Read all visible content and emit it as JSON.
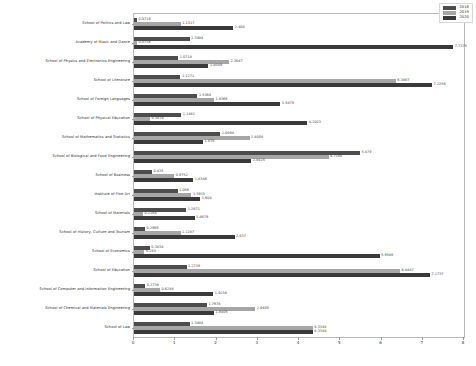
{
  "chart_data": {
    "type": "bar",
    "orientation": "horizontal",
    "title": "",
    "xlabel": "",
    "ylabel": "",
    "xlim": [
      0,
      8
    ],
    "xticks": [
      "0",
      "1",
      "2",
      "3",
      "4",
      "5",
      "6",
      "7",
      "8"
    ],
    "grid": false,
    "legend_position": "upper right",
    "categories": [
      "School of Politics and Law",
      "Academy of Music and Dance",
      "School of Physics and Electronics Engineering",
      "School of Literature",
      "School of Foreign Languages",
      "School of Physical Education",
      "School of Mathematics and Statistics",
      "School of Biological and Food Engineering",
      "School of Business",
      "Institute of Fine Art",
      "School of Materials",
      "School of History, Culture and Tourism",
      "School of Economics",
      "School of Education",
      "School of Computer and Information Engineering",
      "School of Chemical and Materials Engineering",
      "School of Law"
    ],
    "series": [
      {
        "name": "2018",
        "color": "#4d4d4d",
        "values": [
          0.0719,
          1.3484,
          1.0718,
          1.1271,
          1.5364,
          1.1481,
          2.0894,
          5.479,
          0.435,
          1.056,
          1.2671,
          0.2695,
          0.3834,
          1.2739,
          0.2738,
          1.7678,
          1.3484
        ],
        "labels": [
          "0.0719",
          "1.3484",
          "1.0718",
          "1.1271",
          "1.5364",
          "1.1481",
          "2.0894",
          "5.479",
          "0.435",
          "1.056",
          "1.2671",
          "0.2695",
          "0.3834",
          "1.2739",
          "0.2738",
          "1.7678",
          "1.3484"
        ]
      },
      {
        "name": "2019",
        "color": "#a6a6a6",
        "values": [
          1.1317,
          0.0716,
          2.3047,
          6.3467,
          1.9366,
          0.3874,
          2.8008,
          4.7168,
          0.9752,
          1.3915,
          0.2164,
          1.1287,
          0.253,
          6.4487,
          0.6288,
          2.9405,
          4.3348
        ],
        "labels": [
          "1.1317",
          "0.0716",
          "2.3047",
          "6.3467",
          "1.9366",
          "0.3874",
          "2.8008",
          "4.7168",
          "0.9752",
          "1.3915",
          "0.2164",
          "1.1287",
          "0.253",
          "6.4487",
          "0.6288",
          "2.9405",
          "4.3348"
        ]
      },
      {
        "name": "2020",
        "color": "#3a3a3a",
        "values": [
          2.408,
          7.7375,
          1.8049,
          7.2256,
          3.5479,
          4.2023,
          1.675,
          2.8425,
          1.4346,
          1.604,
          1.4679,
          2.437,
          5.9549,
          7.1737,
          1.9238,
          1.9405,
          4.3348
        ],
        "labels": [
          "2.408",
          "7.7375",
          "1.8049",
          "7.2256",
          "3.5479",
          "4.2023",
          "1.675",
          "2.8425",
          "1.4346",
          "1.604",
          "1.4679",
          "2.437",
          "5.9549",
          "7.1737",
          "1.9238",
          "1.9405",
          "4.3348"
        ]
      }
    ]
  },
  "legend": {
    "entries": [
      {
        "label": "2018",
        "color": "#4d4d4d"
      },
      {
        "label": "2019",
        "color": "#a6a6a6"
      },
      {
        "label": "2020",
        "color": "#3a3a3a"
      }
    ]
  }
}
